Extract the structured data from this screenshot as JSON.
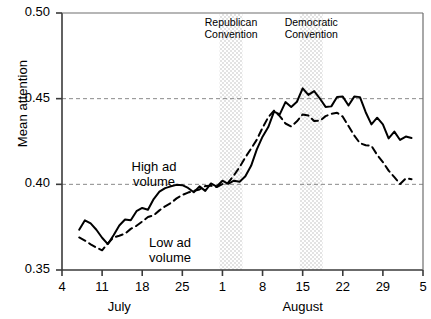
{
  "chart_data": {
    "type": "line",
    "title": "",
    "xlabel": "",
    "ylabel": "Mean attention",
    "ylim": [
      0.35,
      0.5
    ],
    "yticks": [
      "0.35",
      "0.40",
      "0.45",
      "0.50"
    ],
    "ytick_values": [
      0.35,
      0.4,
      0.45,
      0.5
    ],
    "grid": "horizontal dashed gridlines at 0.40 and 0.45",
    "legend_position": "inline annotations on curves",
    "xticks": [
      "4",
      "11",
      "18",
      "25",
      "1",
      "8",
      "15",
      "22",
      "29",
      "5"
    ],
    "xtick_days": [
      0,
      7,
      14,
      21,
      28,
      35,
      42,
      49,
      56,
      63
    ],
    "month_labels": [
      {
        "text": "July",
        "day": 10
      },
      {
        "text": "August",
        "day": 42
      }
    ],
    "xlim_days": [
      0,
      63
    ],
    "annotations": [
      {
        "label": "Republican\nConvention",
        "line1": "Republican",
        "line2": "Convention",
        "band_days": [
          27.5,
          31.5
        ]
      },
      {
        "label": "Democratic\nConvention",
        "line1": "Democratic",
        "line2": "Convention",
        "band_days": [
          41.5,
          45.5
        ]
      }
    ],
    "series": [
      {
        "name": "High ad volume",
        "style": "solid",
        "color": "#000000",
        "label_line1": "High ad",
        "label_line2": "volume",
        "x": [
          3,
          4,
          5,
          6,
          7,
          8,
          9,
          10,
          11,
          12,
          13,
          14,
          15,
          16,
          17,
          18,
          19,
          20,
          21,
          22,
          23,
          24,
          25,
          26,
          27,
          28,
          29,
          30,
          31,
          32,
          33,
          34,
          35,
          36,
          37,
          38,
          39,
          40,
          41,
          42,
          43,
          44,
          45,
          46,
          47,
          48,
          49,
          50,
          51,
          52,
          53,
          54,
          55,
          56,
          57,
          58,
          59,
          60,
          61
        ],
        "y": [
          0.3735,
          0.379,
          0.3772,
          0.3735,
          0.3688,
          0.3651,
          0.3703,
          0.376,
          0.3795,
          0.379,
          0.3843,
          0.3862,
          0.3852,
          0.3914,
          0.3957,
          0.3978,
          0.3988,
          0.3997,
          0.3995,
          0.3979,
          0.3954,
          0.3988,
          0.3962,
          0.4005,
          0.3987,
          0.4021,
          0.4003,
          0.4021,
          0.4015,
          0.4047,
          0.4108,
          0.4204,
          0.4278,
          0.4334,
          0.4424,
          0.4408,
          0.448,
          0.4451,
          0.4482,
          0.456,
          0.4522,
          0.4544,
          0.4501,
          0.4452,
          0.4455,
          0.451,
          0.4512,
          0.446,
          0.4512,
          0.4509,
          0.4421,
          0.435,
          0.4389,
          0.435,
          0.4268,
          0.4308,
          0.4259,
          0.4279,
          0.427
        ]
      },
      {
        "name": "Low ad volume",
        "style": "dashed",
        "color": "#000000",
        "label_line1": "Low ad",
        "label_line2": "volume",
        "x": [
          3,
          4,
          5,
          6,
          7,
          8,
          9,
          10,
          11,
          12,
          13,
          14,
          15,
          16,
          17,
          18,
          19,
          20,
          21,
          22,
          23,
          24,
          25,
          26,
          27,
          28,
          29,
          30,
          31,
          32,
          33,
          34,
          35,
          36,
          37,
          38,
          39,
          40,
          41,
          42,
          43,
          44,
          45,
          46,
          47,
          48,
          49,
          50,
          51,
          52,
          53,
          54,
          55,
          56,
          57,
          58,
          59,
          60,
          61
        ],
        "y": [
          0.369,
          0.3672,
          0.365,
          0.3631,
          0.3615,
          0.3655,
          0.369,
          0.37,
          0.3712,
          0.374,
          0.3758,
          0.3783,
          0.3809,
          0.3819,
          0.3848,
          0.3872,
          0.3891,
          0.3918,
          0.3938,
          0.3952,
          0.3962,
          0.397,
          0.399,
          0.3992,
          0.3984,
          0.4002,
          0.401,
          0.4052,
          0.4101,
          0.4158,
          0.4208,
          0.4261,
          0.433,
          0.4392,
          0.443,
          0.4398,
          0.4355,
          0.4338,
          0.4368,
          0.4408,
          0.4402,
          0.437,
          0.4371,
          0.4398,
          0.4412,
          0.4418,
          0.4395,
          0.434,
          0.4285,
          0.424,
          0.4228,
          0.4225,
          0.4172,
          0.413,
          0.408,
          0.4042,
          0.4002,
          0.4035,
          0.403
        ]
      }
    ]
  },
  "axes": {
    "y_axis_label": "Mean attention"
  }
}
